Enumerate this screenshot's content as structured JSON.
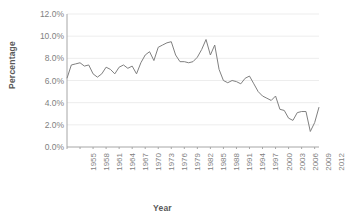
{
  "chart_data": {
    "type": "line",
    "title": "",
    "xlabel": "Year",
    "ylabel": "Percentage",
    "ylim": [
      0,
      12
    ],
    "ytick_labels": [
      "0.0%",
      "2.0%",
      "4.0%",
      "6.0%",
      "8.0%",
      "10.0%",
      "12.0%"
    ],
    "ytick_values": [
      0,
      2,
      4,
      6,
      8,
      10,
      12
    ],
    "xlim": [
      1955,
      2013
    ],
    "xtick_labels": [
      "1955",
      "1958",
      "1961",
      "1964",
      "1967",
      "1970",
      "1973",
      "1976",
      "1979",
      "1982",
      "1985",
      "1988",
      "1991",
      "1994",
      "1997",
      "2000",
      "2003",
      "2006",
      "2009",
      "2012"
    ],
    "xtick_values": [
      1955,
      1958,
      1961,
      1964,
      1967,
      1970,
      1973,
      1976,
      1979,
      1982,
      1985,
      1988,
      1991,
      1994,
      1997,
      2000,
      2003,
      2006,
      2009,
      2012
    ],
    "grid": true,
    "grid_axis": "y",
    "legend": false,
    "series_color": "#808080",
    "x": [
      1955,
      1956,
      1957,
      1958,
      1959,
      1960,
      1961,
      1962,
      1963,
      1964,
      1965,
      1966,
      1967,
      1968,
      1969,
      1970,
      1971,
      1972,
      1973,
      1974,
      1975,
      1976,
      1977,
      1978,
      1979,
      1980,
      1981,
      1982,
      1983,
      1984,
      1985,
      1986,
      1987,
      1988,
      1989,
      1990,
      1991,
      1992,
      1993,
      1994,
      1995,
      1996,
      1997,
      1998,
      1999,
      2000,
      2001,
      2002,
      2003,
      2004,
      2005,
      2006,
      2007,
      2008,
      2009,
      2010,
      2011,
      2012,
      2013
    ],
    "values": [
      6.2,
      7.4,
      7.5,
      7.6,
      7.3,
      7.4,
      6.6,
      6.3,
      6.6,
      7.2,
      7.0,
      6.6,
      7.2,
      7.4,
      7.1,
      7.3,
      6.6,
      7.6,
      8.3,
      8.6,
      7.8,
      9.0,
      9.2,
      9.4,
      9.5,
      8.3,
      7.7,
      7.7,
      7.6,
      7.7,
      8.1,
      8.8,
      9.7,
      8.3,
      9.2,
      7.0,
      6.0,
      5.8,
      6.0,
      5.9,
      5.7,
      6.2,
      6.4,
      5.7,
      5.0,
      4.6,
      4.4,
      4.2,
      4.6,
      3.4,
      3.3,
      2.6,
      2.4,
      3.1,
      3.2,
      3.2,
      1.4,
      2.2,
      3.6
    ],
    "series_name": "Percentage"
  },
  "axis_text_color": "#7f7f7f",
  "axis_title_color": "#595959"
}
